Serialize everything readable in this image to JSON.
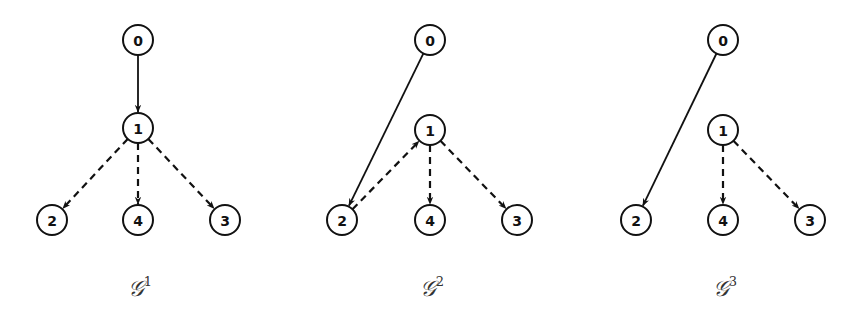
{
  "figure": {
    "graphs": [
      {
        "id": "G1",
        "label_base": "𝒢",
        "label_sup": "1",
        "label_x": 140,
        "nodes": [
          {
            "id": "0",
            "x": 138,
            "y": 40
          },
          {
            "id": "1",
            "x": 138,
            "y": 128
          },
          {
            "id": "2",
            "x": 52,
            "y": 220
          },
          {
            "id": "4",
            "x": 138,
            "y": 220
          },
          {
            "id": "3",
            "x": 225,
            "y": 220
          }
        ],
        "edges": [
          {
            "from": "0",
            "to": "1",
            "style": "solid"
          },
          {
            "from": "1",
            "to": "2",
            "style": "dashed"
          },
          {
            "from": "1",
            "to": "4",
            "style": "dashed"
          },
          {
            "from": "1",
            "to": "3",
            "style": "dashed"
          }
        ]
      },
      {
        "id": "G2",
        "label_base": "𝒢",
        "label_sup": "2",
        "label_x": 432,
        "nodes": [
          {
            "id": "0",
            "x": 430,
            "y": 40
          },
          {
            "id": "1",
            "x": 430,
            "y": 130
          },
          {
            "id": "2",
            "x": 342,
            "y": 220
          },
          {
            "id": "4",
            "x": 430,
            "y": 220
          },
          {
            "id": "3",
            "x": 517,
            "y": 220
          }
        ],
        "edges": [
          {
            "from": "0",
            "to": "2",
            "style": "solid"
          },
          {
            "from": "2",
            "to": "1",
            "style": "dashed"
          },
          {
            "from": "1",
            "to": "4",
            "style": "dashed"
          },
          {
            "from": "1",
            "to": "3",
            "style": "dashed"
          }
        ]
      },
      {
        "id": "G3",
        "label_base": "𝒢",
        "label_sup": "3",
        "label_x": 725,
        "nodes": [
          {
            "id": "0",
            "x": 723,
            "y": 40
          },
          {
            "id": "1",
            "x": 723,
            "y": 130
          },
          {
            "id": "2",
            "x": 636,
            "y": 220
          },
          {
            "id": "4",
            "x": 723,
            "y": 220
          },
          {
            "id": "3",
            "x": 810,
            "y": 220
          }
        ],
        "edges": [
          {
            "from": "0",
            "to": "2",
            "style": "solid"
          },
          {
            "from": "1",
            "to": "4",
            "style": "dashed"
          },
          {
            "from": "1",
            "to": "3",
            "style": "dashed"
          }
        ]
      }
    ],
    "node_radius": 15,
    "stroke_color": "#111111",
    "label_color": "#333333"
  }
}
